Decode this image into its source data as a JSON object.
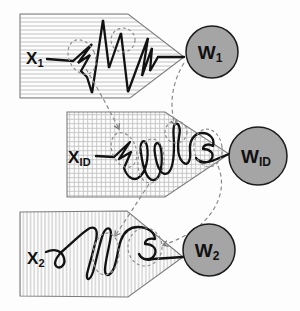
{
  "figure": {
    "type": "signature-to-writer mapping diagram",
    "inputs": [
      {
        "id": "x1",
        "label_main": "X",
        "label_sub": "1",
        "hatch": "horizontal-lines",
        "content": "zigzag-scribble",
        "highlight_count": 2
      },
      {
        "id": "xid",
        "label_main": "X",
        "label_sub": "ID",
        "hatch": "grid",
        "content": "loopy-scribble",
        "highlight_count": 4
      },
      {
        "id": "x2",
        "label_main": "X",
        "label_sub": "2",
        "hatch": "vertical-lines",
        "content": "loopy-scribble",
        "highlight_count": 2
      }
    ],
    "outputs": [
      {
        "id": "w1",
        "label_main": "W",
        "label_sub": "1"
      },
      {
        "id": "wid",
        "label_main": "W",
        "label_sub": "ID"
      },
      {
        "id": "w2",
        "label_main": "W",
        "label_sub": "2"
      }
    ],
    "colors": {
      "background": "#fdfdfd",
      "node_fill": "#a5a5a5",
      "node_stroke": "#1c1c1c",
      "panel_outline": "#7d7d7d",
      "hatch_line": "#c2c2c2",
      "ink": "#121212",
      "dashed_annotation": "#8f8f8f"
    }
  }
}
